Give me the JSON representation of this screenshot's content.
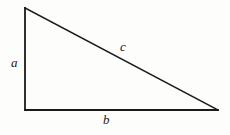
{
  "figure": {
    "kind": "right-triangle-diagram",
    "background_color": "#fdfdfc",
    "stroke_color": "#1a1a1a",
    "label_color": "#1a1a1a",
    "canvas": {
      "width": 230,
      "height": 135
    },
    "vertices": {
      "apex": {
        "x": 25,
        "y": 8
      },
      "right_angle": {
        "x": 25,
        "y": 110
      },
      "base_right": {
        "x": 218,
        "y": 110
      }
    },
    "sides": [
      {
        "name": "vertical-leg",
        "label": "a",
        "from": {
          "x": 25,
          "y": 8
        },
        "to": {
          "x": 25,
          "y": 110
        },
        "stroke_width": 1.8
      },
      {
        "name": "horizontal-leg",
        "label": "b",
        "from": {
          "x": 25,
          "y": 110
        },
        "to": {
          "x": 218,
          "y": 110
        },
        "stroke_width": 1.8
      },
      {
        "name": "hypotenuse",
        "label": "c",
        "from": {
          "x": 25,
          "y": 8
        },
        "to": {
          "x": 218,
          "y": 110
        },
        "stroke_width": 1.6
      }
    ],
    "labels": {
      "a": "a",
      "b": "b",
      "c": "c"
    }
  }
}
